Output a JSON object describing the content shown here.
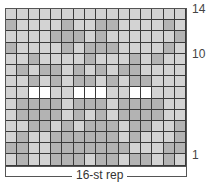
{
  "chart_data": {
    "type": "heatmap",
    "title": "",
    "legend": {
      "L": "light gray",
      "M": "medium gray",
      "W": "white"
    },
    "colors": {
      "L": "#d3d3d3",
      "M": "#b3b3b3",
      "W": "#ffffff"
    },
    "columns": 16,
    "rows": 14,
    "rows_top_to_bottom": [
      "LLLLLLLLLLLLLLLL",
      "MLLLLMLLMMLLLLML",
      "LLLLMMMLMLLLLLLM",
      "MLLLLMLMMMLLLLML",
      "LLMLLLLMLLLMLMLL",
      "LMLMMLMLMLMMLLLL",
      "LLMLMLMMLMLMMLLL",
      "LLWWLLWWWLLWWLLL",
      "LMMMMLMMMLMMMMLL",
      "LMMMMLMLMLMMMMLL",
      "LLMMLMLMMMLMMLLM",
      "LMLLMMMMMMLMLLLM",
      "MMLLMMMMMMMLLLMM",
      "LMLLMMMLMMLMMLML"
    ],
    "row_labels": [
      {
        "row": 14,
        "text": "14"
      },
      {
        "row": 10,
        "text": "10"
      },
      {
        "row": 1,
        "text": "1"
      }
    ],
    "xlabel": "16-st rep"
  }
}
